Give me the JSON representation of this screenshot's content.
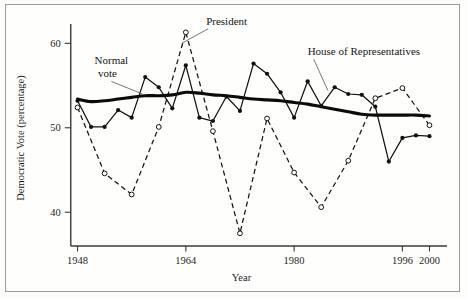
{
  "figure": {
    "background": "#fdfdfb",
    "frame_color": "#9a9a96"
  },
  "chart_data": {
    "type": "line",
    "title": "",
    "xlabel": "Year",
    "ylabel": "Democratic Vote (percentage)",
    "xlim": [
      1946,
      2002
    ],
    "ylim": [
      36,
      63
    ],
    "xticks": [
      1948,
      1964,
      1980,
      1996,
      2000
    ],
    "xticklabels": [
      "1948",
      "1964",
      "1980",
      "1996",
      "2000"
    ],
    "yticks": [
      40,
      50,
      60
    ],
    "yticklabels": [
      "40",
      "50",
      "60"
    ],
    "grid": false,
    "legend": "inline-annotations",
    "annotations": [
      {
        "text": "Normal vote",
        "x": 1953,
        "y": 57.5,
        "points_to": "normal-vote-series"
      },
      {
        "text": "President",
        "x": 1967,
        "y": 62.2,
        "points_to": "president-series"
      },
      {
        "text": "House of Representatives",
        "x": 1982,
        "y": 58.6,
        "points_to": "house-series"
      }
    ],
    "series": [
      {
        "name": "House of Representatives",
        "style": "solid-filled-markers",
        "color": "#111110",
        "x": [
          1948,
          1950,
          1952,
          1954,
          1956,
          1958,
          1960,
          1962,
          1964,
          1966,
          1968,
          1970,
          1972,
          1974,
          1976,
          1978,
          1980,
          1982,
          1984,
          1986,
          1988,
          1990,
          1992,
          1994,
          1996,
          1998,
          2000
        ],
        "values": [
          53.2,
          50.1,
          50.1,
          52.1,
          51.2,
          56.0,
          54.8,
          52.3,
          57.4,
          51.2,
          50.8,
          53.7,
          52.0,
          57.6,
          56.4,
          54.2,
          51.2,
          55.5,
          52.6,
          54.8,
          54.0,
          53.9,
          52.5,
          46.0,
          48.8,
          49.1,
          49.0
        ]
      },
      {
        "name": "President",
        "style": "dashed-open-markers",
        "color": "#151514",
        "x": [
          1948,
          1952,
          1956,
          1960,
          1964,
          1968,
          1972,
          1976,
          1980,
          1984,
          1988,
          1992,
          1996,
          2000
        ],
        "values": [
          52.4,
          44.6,
          42.1,
          50.1,
          61.3,
          49.6,
          37.5,
          51.1,
          44.7,
          40.6,
          46.1,
          53.5,
          54.7,
          50.3
        ]
      },
      {
        "name": "Normal vote",
        "style": "thick-smooth-solid",
        "color": "#0b0b0a",
        "x": [
          1948,
          1950,
          1952,
          1954,
          1956,
          1958,
          1960,
          1962,
          1964,
          1966,
          1968,
          1970,
          1972,
          1974,
          1976,
          1978,
          1980,
          1982,
          1984,
          1986,
          1988,
          1990,
          1992,
          1994,
          1996,
          1998,
          2000
        ],
        "values": [
          53.4,
          53.1,
          53.2,
          53.4,
          53.6,
          53.8,
          53.8,
          53.9,
          54.2,
          54.1,
          53.9,
          53.8,
          53.6,
          53.4,
          53.3,
          53.2,
          53.0,
          52.8,
          52.5,
          52.2,
          51.9,
          51.6,
          51.5,
          51.5,
          51.5,
          51.5,
          51.4
        ]
      }
    ]
  }
}
